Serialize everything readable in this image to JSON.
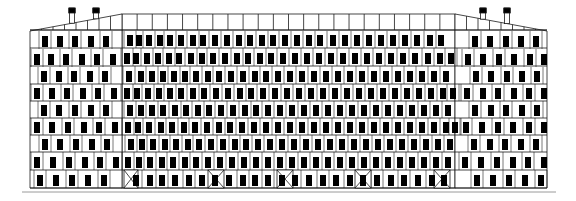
{
  "document": {
    "title": "Building Elevation",
    "drawing_type": "architectural-elevation",
    "view": "front elevation",
    "canvas": {
      "width": 576,
      "height": 201
    }
  },
  "colors": {
    "background": "#ffffff",
    "line": "#1a1a1a",
    "window_fill": "#000000",
    "ground_line": "#9a9a9a",
    "wall_fill": "#ffffff"
  },
  "geometry": {
    "building_left": 30,
    "building_right": 547,
    "ground_y": 188,
    "ground_line_left": 22,
    "ground_line_right": 556,
    "center_left": 122,
    "center_right": 455,
    "center_top": 14,
    "wing_top_outer": 31,
    "parapet_band_bottom": 30,
    "stroke_width": 0.8
  },
  "structure": {
    "massing": "central tall block flanked by two lower symmetric wings",
    "central_block": {
      "name": "central-block",
      "floors": 9,
      "has_parapet_band": true,
      "bays": 22,
      "floor_lines_y": [
        30,
        48,
        66,
        84,
        101,
        118,
        135,
        152,
        170,
        188
      ]
    },
    "left_wing": {
      "name": "left-wing",
      "floors": 8,
      "roof": "sloping, rising toward center",
      "chimneys": 2,
      "bays": 8
    },
    "right_wing": {
      "name": "right-wing",
      "floors": 8,
      "roof": "sloping, rising toward center",
      "chimneys": 2,
      "bays": 8
    }
  },
  "chart_data": {
    "type": "diagram",
    "title": "Building Elevation",
    "left_roof_chimneys_x": [
      72,
      96
    ],
    "right_roof_chimneys_x": [
      483,
      507
    ],
    "chimney_top_y": 8,
    "chimney_width": 5,
    "chimney_cap_height": 5,
    "center_floor_rows": [
      {
        "y": 31,
        "h": 17,
        "windows": [
          127,
          136,
          146,
          157,
          167,
          178,
          190,
          200,
          212,
          224,
          236,
          247,
          259,
          270,
          282,
          294,
          306,
          317,
          330,
          342,
          354,
          366,
          378,
          390,
          402,
          414,
          427,
          438
        ]
      },
      {
        "y": 48,
        "h": 18,
        "windows": [
          124,
          133,
          144,
          155,
          166,
          176,
          188,
          199,
          210,
          222,
          234,
          245,
          257,
          268,
          280,
          292,
          304,
          316,
          328,
          340,
          352,
          364,
          376,
          388,
          400,
          412,
          425,
          437,
          448
        ]
      },
      {
        "y": 66,
        "h": 18,
        "windows": [
          126,
          138,
          149,
          160,
          171,
          182,
          193,
          205,
          216,
          228,
          240,
          252,
          263,
          275,
          287,
          299,
          311,
          323,
          335,
          347,
          359,
          371,
          383,
          395,
          407,
          419,
          431,
          443
        ]
      },
      {
        "y": 84,
        "h": 17,
        "windows": [
          124,
          134,
          145,
          156,
          167,
          178,
          190,
          201,
          213,
          225,
          237,
          248,
          260,
          272,
          284,
          296,
          308,
          320,
          332,
          344,
          356,
          368,
          380,
          392,
          404,
          416,
          428,
          440,
          450
        ]
      },
      {
        "y": 101,
        "h": 17,
        "windows": [
          127,
          138,
          149,
          160,
          172,
          183,
          195,
          206,
          218,
          230,
          242,
          253,
          265,
          277,
          289,
          301,
          313,
          325,
          337,
          349,
          361,
          373,
          385,
          397,
          409,
          421,
          433,
          445
        ]
      },
      {
        "y": 118,
        "h": 17,
        "windows": [
          125,
          135,
          146,
          158,
          169,
          181,
          192,
          204,
          216,
          227,
          239,
          251,
          263,
          275,
          287,
          299,
          311,
          323,
          335,
          347,
          359,
          371,
          383,
          395,
          407,
          419,
          431,
          443,
          452
        ]
      },
      {
        "y": 135,
        "h": 17,
        "windows": [
          128,
          139,
          150,
          162,
          173,
          185,
          196,
          208,
          220,
          232,
          243,
          255,
          267,
          279,
          291,
          303,
          315,
          327,
          339,
          351,
          363,
          375,
          387,
          399,
          411,
          423,
          435,
          447
        ]
      },
      {
        "y": 152,
        "h": 18,
        "windows": [
          125,
          136,
          147,
          159,
          170,
          182,
          193,
          205,
          217,
          229,
          241,
          253,
          265,
          277,
          289,
          301,
          313,
          325,
          337,
          349,
          361,
          373,
          385,
          397,
          409,
          421,
          433,
          445
        ]
      },
      {
        "y": 170,
        "h": 18,
        "windows": [
          133,
          147,
          159,
          172,
          186,
          199,
          212,
          226,
          240,
          252,
          265,
          279,
          292,
          306,
          320,
          333,
          347,
          360,
          374,
          388,
          401,
          415,
          429,
          441
        ]
      }
    ],
    "center_braced_bays": [
      {
        "x": 124,
        "w": 14
      },
      {
        "x": 208,
        "w": 16
      },
      {
        "x": 277,
        "w": 16
      },
      {
        "x": 355,
        "w": 16
      },
      {
        "x": 434,
        "w": 16
      }
    ],
    "left_wing_floor_rows": [
      {
        "y": 31,
        "h": 18,
        "windows": [
          42,
          57,
          72,
          88,
          103
        ]
      },
      {
        "y": 49,
        "h": 18,
        "windows": [
          34,
          48,
          63,
          79,
          94,
          110
        ]
      },
      {
        "y": 67,
        "h": 17,
        "windows": [
          41,
          56,
          71,
          87,
          102
        ]
      },
      {
        "y": 84,
        "h": 17,
        "windows": [
          34,
          49,
          64,
          80,
          95,
          111
        ]
      },
      {
        "y": 101,
        "h": 17,
        "windows": [
          41,
          56,
          72,
          88,
          103
        ]
      },
      {
        "y": 118,
        "h": 17,
        "windows": [
          34,
          49,
          65,
          81,
          96,
          112
        ]
      },
      {
        "y": 135,
        "h": 17,
        "windows": [
          42,
          57,
          73,
          89,
          104
        ]
      },
      {
        "y": 152,
        "h": 18,
        "windows": [
          34,
          50,
          66,
          82,
          97,
          113
        ]
      },
      {
        "y": 170,
        "h": 18,
        "windows": [
          37,
          53,
          69,
          85,
          101
        ]
      }
    ],
    "right_wing_floor_rows": [
      {
        "y": 31,
        "h": 18,
        "windows": [
          472,
          487,
          503,
          518,
          533
        ]
      },
      {
        "y": 49,
        "h": 18,
        "windows": [
          465,
          480,
          496,
          511,
          527,
          541
        ]
      },
      {
        "y": 67,
        "h": 17,
        "windows": [
          473,
          488,
          504,
          519,
          534
        ]
      },
      {
        "y": 84,
        "h": 17,
        "windows": [
          464,
          480,
          495,
          511,
          526,
          541
        ]
      },
      {
        "y": 101,
        "h": 17,
        "windows": [
          472,
          488,
          503,
          519,
          534
        ]
      },
      {
        "y": 118,
        "h": 17,
        "windows": [
          463,
          479,
          495,
          510,
          526,
          541
        ]
      },
      {
        "y": 135,
        "h": 17,
        "windows": [
          471,
          487,
          502,
          518,
          533
        ]
      },
      {
        "y": 152,
        "h": 18,
        "windows": [
          462,
          478,
          494,
          510,
          525,
          541
        ]
      },
      {
        "y": 170,
        "h": 18,
        "windows": [
          474,
          490,
          506,
          522,
          538
        ]
      }
    ],
    "window_width": 6,
    "window_height_ratio": 0.62
  },
  "labels": {
    "caption": ""
  }
}
